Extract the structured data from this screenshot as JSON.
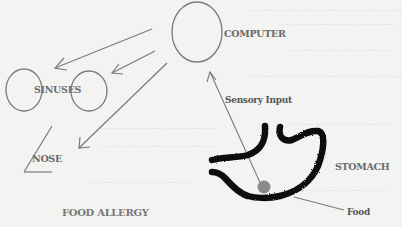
{
  "diagram": {
    "type": "flow-diagram",
    "title": "FOOD ALLERGY",
    "nodes": [
      {
        "id": "computer",
        "label": "COMPUTER",
        "shape": "circle"
      },
      {
        "id": "sinuses",
        "label": "SINUSES",
        "shape": "two-circles"
      },
      {
        "id": "nose",
        "label": "NOSE",
        "shape": "angle-line"
      },
      {
        "id": "stomach",
        "label": "STOMACH",
        "shape": "stomach-outline"
      },
      {
        "id": "food",
        "label": "Food",
        "shape": "dot"
      }
    ],
    "edges": [
      {
        "from": "food",
        "to": "computer",
        "label": "Sensory Input"
      },
      {
        "from": "computer",
        "to": "sinuses",
        "label": ""
      },
      {
        "from": "computer",
        "to": "sinuses",
        "label": ""
      },
      {
        "from": "computer",
        "to": "nose",
        "label": ""
      }
    ]
  },
  "labels": {
    "computer": "COMPUTER",
    "sinuses": "SINUSES",
    "sensory_input": "Sensory Input",
    "nose": "NOSE",
    "stomach": "STOMACH",
    "food": "Food",
    "food_allergy": "FOOD ALLERGY"
  },
  "colors": {
    "background": "#f3f3f1",
    "line": "#7a7a7a",
    "stomach_outline": "#111111",
    "food_dot": "#888888",
    "label_text": "#6a6a6a"
  }
}
